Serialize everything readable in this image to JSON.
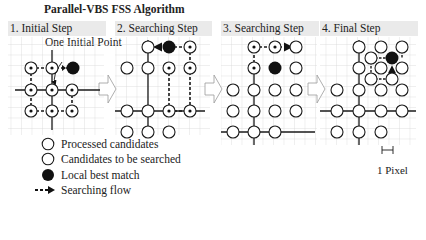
{
  "title": "Parallel-VBS FSS Algorithm",
  "panels": [
    {
      "label": "1. Initial Step"
    },
    {
      "label": "2. Searching Step"
    },
    {
      "label": "3. Searching Step"
    },
    {
      "label": "4. Final Step"
    }
  ],
  "annotation": "One Initial Point",
  "legend": {
    "items": [
      {
        "symbol": "processed-circle",
        "label": "Processed candidates"
      },
      {
        "symbol": "candidate-circle",
        "label": "Candidates to be searched"
      },
      {
        "symbol": "best-match-dot",
        "label": "Local best match"
      },
      {
        "symbol": "search-flow-arrow",
        "label": "Searching flow"
      }
    ]
  },
  "scale": {
    "label": "1 Pixel"
  },
  "colors": {
    "stroke": "#1a1a1a",
    "grid": "#cfcfcf",
    "label_bg": "#eaeaea",
    "fill": "#111111"
  }
}
